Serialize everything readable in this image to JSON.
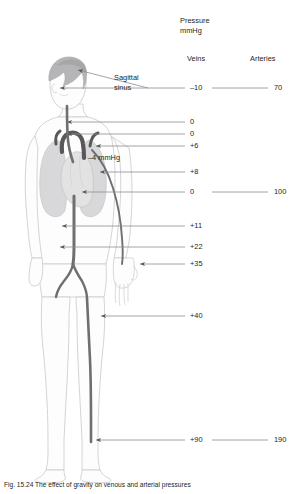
{
  "figure": {
    "caption": "Fig. 15.24  The effect of gravity on venous and arterial pressures",
    "header": {
      "title_line1": "Pressure",
      "title_line2": "mmHg",
      "col_veins": "Veins",
      "col_arteries": "Arteries"
    },
    "annotations": [
      {
        "name": "sagittal-sinus",
        "label_line1": "Sagittal",
        "label_line2": "sinus"
      },
      {
        "name": "intrathoracic",
        "label": "–4 mmHg"
      }
    ],
    "rows": [
      {
        "name": "sagittal-sinus",
        "vein": "–10",
        "artery": "70",
        "y": 88,
        "arrow_x": 60,
        "connector": true
      },
      {
        "name": "neck-upper",
        "vein": "0",
        "artery": "",
        "y": 122,
        "arrow_x": 67,
        "connector": false
      },
      {
        "name": "neck-lower",
        "vein": "0",
        "artery": "",
        "y": 134,
        "arrow_x": 67,
        "connector": false
      },
      {
        "name": "aortic-arch",
        "vein": "+6",
        "artery": "",
        "y": 146,
        "arrow_x": 96,
        "connector": false
      },
      {
        "name": "right-atrium-upper",
        "vein": "+8",
        "artery": "",
        "y": 172,
        "arrow_x": 100,
        "connector": false
      },
      {
        "name": "heart-level",
        "vein": "0",
        "artery": "100",
        "y": 192,
        "arrow_x": 82,
        "connector": true
      },
      {
        "name": "abdominal-vena-cava",
        "vein": "+11",
        "artery": "",
        "y": 226,
        "arrow_x": 62,
        "connector": false
      },
      {
        "name": "iliac-vein",
        "vein": "+22",
        "artery": "",
        "y": 247,
        "arrow_x": 60,
        "connector": false
      },
      {
        "name": "hand-wrist",
        "vein": "+35",
        "artery": "",
        "y": 264,
        "arrow_x": 140,
        "connector": false
      },
      {
        "name": "thigh-vein",
        "vein": "+40",
        "artery": "",
        "y": 316,
        "arrow_x": 101,
        "connector": false
      },
      {
        "name": "ankle",
        "vein": "+90",
        "artery": "190",
        "y": 440,
        "arrow_x": 96,
        "connector": true
      }
    ],
    "colors": {
      "body_outline": "#c9c9cc",
      "body_fill": "#fdfdfd",
      "vessel": "#6f6f72",
      "vessel_dark": "#58585b",
      "lung": "#d2d2d4",
      "heart": "#e2e2e2",
      "sinus": "#b9b9bc",
      "hair": "#b5b5b8",
      "leader": "#8d8d90",
      "text": "#231f20"
    }
  }
}
